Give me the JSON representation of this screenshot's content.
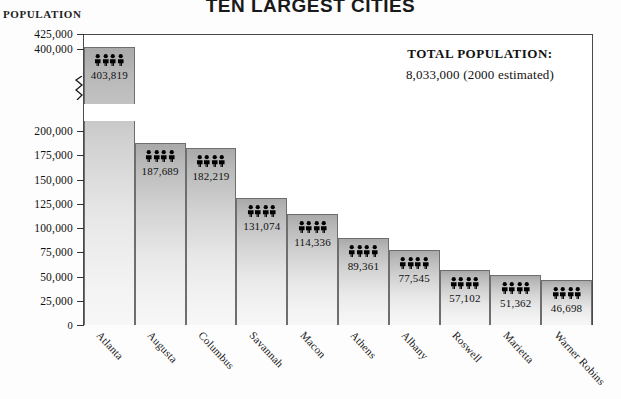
{
  "chart_data": {
    "type": "bar",
    "title": "TEN LARGEST CITIES",
    "ylabel": "POPULATION",
    "xlabel": "",
    "categories": [
      "Atlanta",
      "Augusta",
      "Columbus",
      "Savannah",
      "Macon",
      "Athens",
      "Albany",
      "Roswell",
      "Marietta",
      "Warner Robins"
    ],
    "values": [
      403819,
      187689,
      182219,
      131074,
      114336,
      89361,
      77545,
      57102,
      51362,
      46698
    ],
    "value_labels": [
      "403,819",
      "187,689",
      "182,219",
      "131,074",
      "114,336",
      "89,361",
      "77,545",
      "57,102",
      "51,362",
      "46,698"
    ],
    "ytick_labels": [
      "425,000",
      "400,000",
      "200,000",
      "175,000",
      "150,000",
      "125,000",
      "100,000",
      "75,000",
      "50,000",
      "25,000",
      "0"
    ],
    "ytick_values": [
      425000,
      400000,
      200000,
      175000,
      150000,
      125000,
      100000,
      75000,
      50000,
      25000,
      0
    ],
    "ylim": [
      0,
      425000
    ],
    "axis_break": true,
    "axis_break_note": "y-axis broken between 200,000 and 400,000",
    "grid": false,
    "legend": "none",
    "bar_icon": "people-icon",
    "annotation": {
      "line1": "TOTAL POPULATION:",
      "line2": "8,033,000  (2000 estimated)"
    }
  }
}
